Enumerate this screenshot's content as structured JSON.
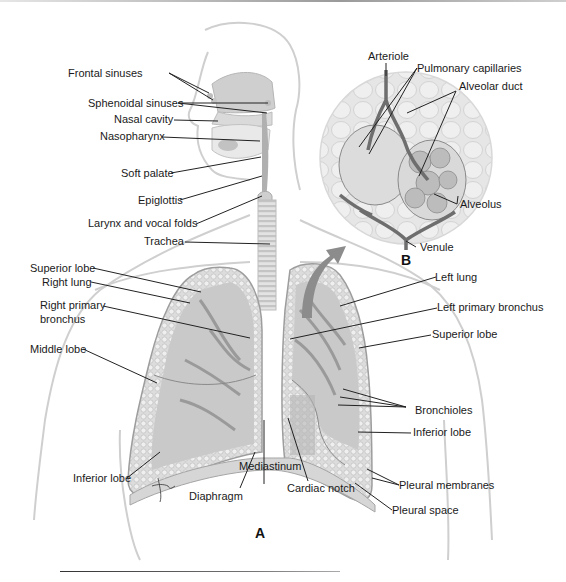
{
  "figure": {
    "panels": {
      "A": "A",
      "B": "B"
    },
    "labels_head": {
      "frontal_sinuses": "Frontal sinuses",
      "sphenoidal_sinuses": "Sphenoidal sinuses",
      "nasal_cavity": "Nasal cavity",
      "nasopharynx": "Nasopharynx",
      "soft_palate": "Soft palate",
      "epiglottis": "Epiglottis",
      "larynx": "Larynx and vocal folds",
      "trachea": "Trachea"
    },
    "labels_alveoli": {
      "arteriole": "Arteriole",
      "pulmonary_capillaries": "Pulmonary capillaries",
      "alveolar_duct": "Alveolar duct",
      "alveolus": "Alveolus",
      "venule": "Venule"
    },
    "labels_right_side": {
      "superior_lobe": "Superior lobe",
      "right_lung": "Right lung",
      "right_primary_bronchus_1": "Right primary",
      "right_primary_bronchus_2": "bronchus",
      "middle_lobe": "Middle lobe",
      "inferior_lobe": "Inferior lobe"
    },
    "labels_center": {
      "mediastinum": "Mediastinum",
      "diaphragm": "Diaphragm",
      "cardiac_notch": "Cardiac notch"
    },
    "labels_left_side": {
      "left_lung": "Left lung",
      "left_primary_bronchus": "Left primary bronchus",
      "superior_lobe": "Superior lobe",
      "bronchioles": "Bronchioles",
      "inferior_lobe": "Inferior lobe",
      "pleural_membranes": "Pleural membranes",
      "pleural_space": "Pleural space"
    },
    "colors": {
      "outline": "#c8c8c8",
      "lung_fill": "#d2d2d2",
      "lung_dark": "#a9a9a9",
      "vessel": "#7a7a7a",
      "arrow": "#8c8c8c",
      "leader": "#222222"
    }
  }
}
